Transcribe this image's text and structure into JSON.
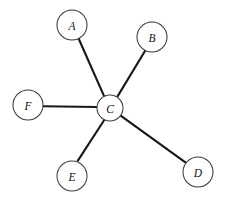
{
  "diagram": {
    "type": "star-graph",
    "canvas": {
      "width": 225,
      "height": 203,
      "background": "#ffffff"
    },
    "style": {
      "edge_color": "#16161a",
      "edge_width": 2.1,
      "node_fill": "#ffffff",
      "node_stroke": "#3a3a3e",
      "node_stroke_width": 1.05,
      "label_color": "#101014",
      "label_style": "italic serif"
    },
    "hub": "C",
    "nodes": [
      {
        "id": "A",
        "label": "A",
        "cx": 72,
        "cy": 25,
        "r": 15
      },
      {
        "id": "B",
        "label": "B",
        "cx": 152,
        "cy": 37,
        "r": 15
      },
      {
        "id": "C",
        "label": "C",
        "cx": 110,
        "cy": 108,
        "r": 13
      },
      {
        "id": "D",
        "label": "D",
        "cx": 198,
        "cy": 172,
        "r": 15
      },
      {
        "id": "E",
        "label": "E",
        "cx": 72,
        "cy": 176,
        "r": 15
      },
      {
        "id": "F",
        "label": "F",
        "cx": 28,
        "cy": 105,
        "r": 15
      }
    ],
    "edges": [
      {
        "id": "C-A",
        "from": "C",
        "to": "A",
        "x1": 104.2,
        "y1": 96.4,
        "x2": 78.6,
        "y2": 38.5
      },
      {
        "id": "C-B",
        "from": "C",
        "to": "B",
        "x1": 117.1,
        "y1": 97.1,
        "x2": 145.6,
        "y2": 50.0
      },
      {
        "id": "C-D",
        "from": "C",
        "to": "D",
        "x1": 120.3,
        "y1": 115.4,
        "x2": 186.1,
        "y2": 162.8
      },
      {
        "id": "C-E",
        "from": "C",
        "to": "E",
        "x1": 104.4,
        "y1": 119.7,
        "x2": 77.4,
        "y2": 161.4
      },
      {
        "id": "C-F",
        "from": "C",
        "to": "F",
        "x1": 97.0,
        "y1": 107.0,
        "x2": 43.0,
        "y2": 106.2
      }
    ]
  }
}
